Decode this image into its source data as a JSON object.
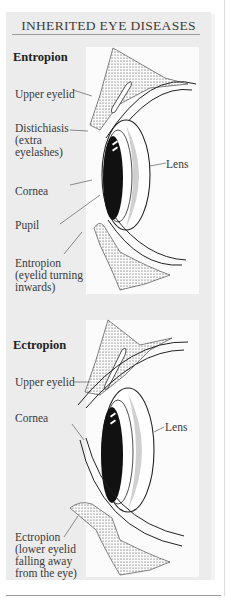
{
  "title": "INHERITED EYE DISEASES",
  "sections": [
    {
      "heading": "Entropion",
      "labels": {
        "upper_eyelid": "Upper eyelid",
        "distichiasis_1": "Distichiasis",
        "distichiasis_2": "(extra",
        "distichiasis_3": "eyelashes)",
        "lens": "Lens",
        "cornea": "Cornea",
        "pupil": "Pupil",
        "entropion_1": "Entropion",
        "entropion_2": "(eyelid turning",
        "entropion_3": "inwards)"
      }
    },
    {
      "heading": "Ectropion",
      "labels": {
        "upper_eyelid": "Upper eyelid",
        "cornea": "Cornea",
        "lens": "Lens",
        "ectropion_1": "Ectropion",
        "ectropion_2": "(lower eyelid",
        "ectropion_3": "falling away",
        "ectropion_4": "from the eye)"
      }
    }
  ],
  "colors": {
    "panel_bg": "#ececec",
    "illustration_bg": "#fbfbfb",
    "ink": "#222222"
  }
}
